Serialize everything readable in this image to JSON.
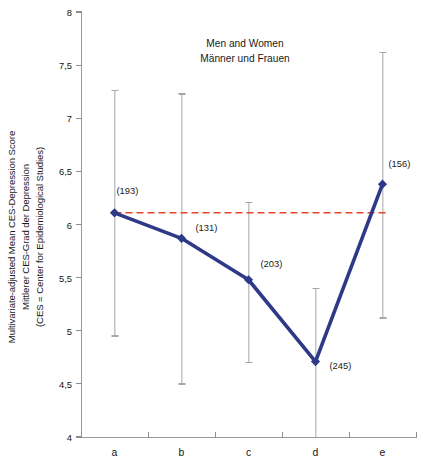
{
  "chart_data": {
    "type": "line",
    "title": "Men and Women\nMänner und Frauen",
    "title_lines": [
      "Men and Women",
      "Männer und Frauen"
    ],
    "ylabel_lines": [
      "Multivariate-adjusted Mean CES-Depression Score",
      "Mittlerer CES-Grad der Depression",
      "(CES = Center for Epidemiological Studies)"
    ],
    "xlabel": "",
    "categories": [
      "a",
      "b",
      "c",
      "d",
      "e"
    ],
    "values": [
      6.11,
      5.87,
      5.48,
      4.71,
      6.38
    ],
    "point_labels": [
      "(193)",
      "(131)",
      "(203)",
      "(245)",
      "(156)"
    ],
    "counts": [
      193,
      131,
      203,
      245,
      156
    ],
    "error_high": [
      7.26,
      7.23,
      6.21,
      5.4,
      7.62
    ],
    "error_low": [
      4.95,
      4.5,
      4.7,
      4.0,
      5.12
    ],
    "ylim": [
      4,
      8
    ],
    "ytick_values": [
      8,
      7.5,
      7,
      6.5,
      6,
      5.5,
      5,
      4.5,
      4
    ],
    "ytick_labels": [
      "8",
      "7,5",
      "7",
      "6,5",
      "6",
      "5,5",
      "5",
      "4,5",
      "4"
    ],
    "reference_line": {
      "value": 6.11,
      "style": "dashed",
      "color": "#e8442a",
      "from_category": "a",
      "to_category": "e"
    },
    "grid": false,
    "legend": "none",
    "series_color": "#2e3a87",
    "marker": "diamond",
    "errorbar_color": "#a6a6a6",
    "axis_color": "#9a9a9a"
  }
}
